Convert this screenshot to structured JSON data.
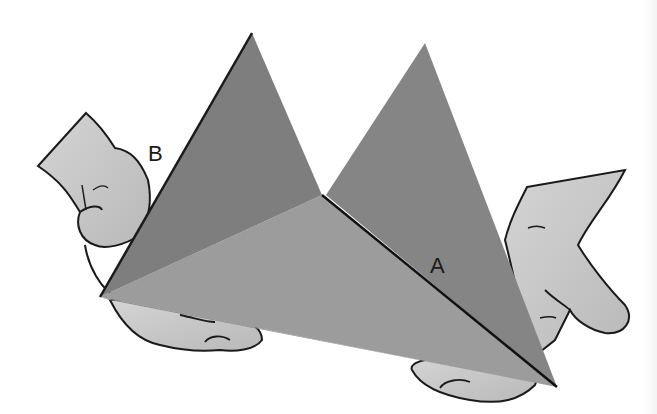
{
  "figure": {
    "labels": {
      "edge_a": "A",
      "edge_b": "B"
    },
    "colors": {
      "background": "#ffffff",
      "left_face": "#7f7f7f",
      "right_face": "#808080",
      "bottom_face": "#9a9a9a",
      "hand_fill": "#c8c8c8",
      "outline": "#1a1a1a"
    }
  }
}
